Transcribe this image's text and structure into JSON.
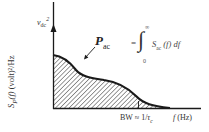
{
  "figure": {
    "y_axis_label": {
      "func": "S",
      "sub": "P",
      "arg": "(f)",
      "units": " (volt)²/Hz"
    },
    "impulse_label": {
      "base": "v",
      "sub": "dc",
      "sup": "2"
    },
    "area_label": {
      "base": "P",
      "sub": "ac"
    },
    "equation": {
      "equals": "=",
      "integral": "∫",
      "upper_limit": "∞",
      "lower_limit": "0",
      "integrand_func": "S",
      "integrand_sub": "ac",
      "integrand_rest": "(f) df"
    },
    "bandwidth_label": {
      "prefix": "BW ≈ 1/",
      "tau": "τ",
      "tau_sub": "c"
    },
    "x_axis_label": {
      "var": "f",
      "units": " (Hz)"
    },
    "colors": {
      "line": "#1a1a1a",
      "hatch": "#333333",
      "background": "#ffffff"
    }
  }
}
